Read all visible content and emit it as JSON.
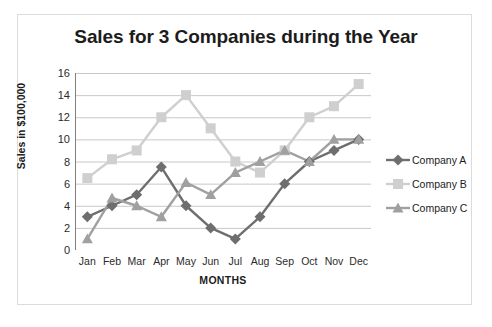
{
  "chart_data": {
    "type": "line",
    "title": "Sales for 3 Companies during the Year",
    "xlabel": "MONTHS",
    "ylabel": "Sales in $100,000",
    "categories": [
      "Jan",
      "Feb",
      "Mar",
      "Apr",
      "May",
      "Jun",
      "Jul",
      "Aug",
      "Sep",
      "Oct",
      "Nov",
      "Dec"
    ],
    "ylim": [
      0,
      16
    ],
    "yticks": [
      0,
      2,
      4,
      6,
      8,
      10,
      12,
      14,
      16
    ],
    "grid": "horizontal",
    "legend_position": "right",
    "series": [
      {
        "name": "Company A",
        "marker": "diamond",
        "color": "#6e6e6e",
        "values": [
          3,
          4,
          5,
          7.5,
          4,
          2,
          1,
          3,
          6,
          8,
          9,
          10
        ]
      },
      {
        "name": "Company B",
        "marker": "square",
        "color": "#cfcfcf",
        "values": [
          6.5,
          8.2,
          9,
          12,
          14,
          11,
          8,
          7,
          9,
          12,
          13,
          15
        ]
      },
      {
        "name": "Company C",
        "marker": "triangle",
        "color": "#a0a0a0",
        "values": [
          1,
          4.7,
          4,
          3,
          6.1,
          5,
          7,
          8,
          9,
          8,
          10,
          10
        ]
      }
    ]
  }
}
